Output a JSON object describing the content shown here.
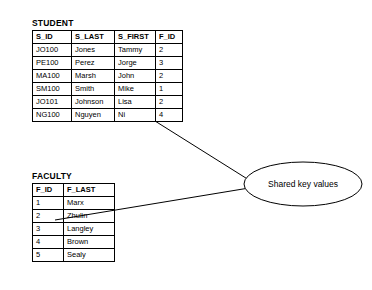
{
  "diagram": {
    "annotation": {
      "label": "Shared key values"
    },
    "tables": [
      {
        "name": "STUDENT",
        "title": "STUDENT",
        "columns": [
          "S_ID",
          "S_LAST",
          "S_FIRST",
          "F_ID"
        ],
        "rows": [
          [
            "JO100",
            "Jones",
            "Tammy",
            "2"
          ],
          [
            "PE100",
            "Perez",
            "Jorge",
            "3"
          ],
          [
            "MA100",
            "Marsh",
            "John",
            "2"
          ],
          [
            "SM100",
            "Smith",
            "Mike",
            "1"
          ],
          [
            "JO101",
            "Johnson",
            "Lisa",
            "2"
          ],
          [
            "NG100",
            "Nguyen",
            "Ni",
            "4"
          ]
        ]
      },
      {
        "name": "FACULTY",
        "title": "FACULTY",
        "columns": [
          "F_ID",
          "F_LAST"
        ],
        "rows": [
          [
            "1",
            "Marx"
          ],
          [
            "2",
            "Zhulin"
          ],
          [
            "3",
            "Langley"
          ],
          [
            "4",
            "Brown"
          ],
          [
            "5",
            "Sealy"
          ]
        ]
      }
    ]
  }
}
